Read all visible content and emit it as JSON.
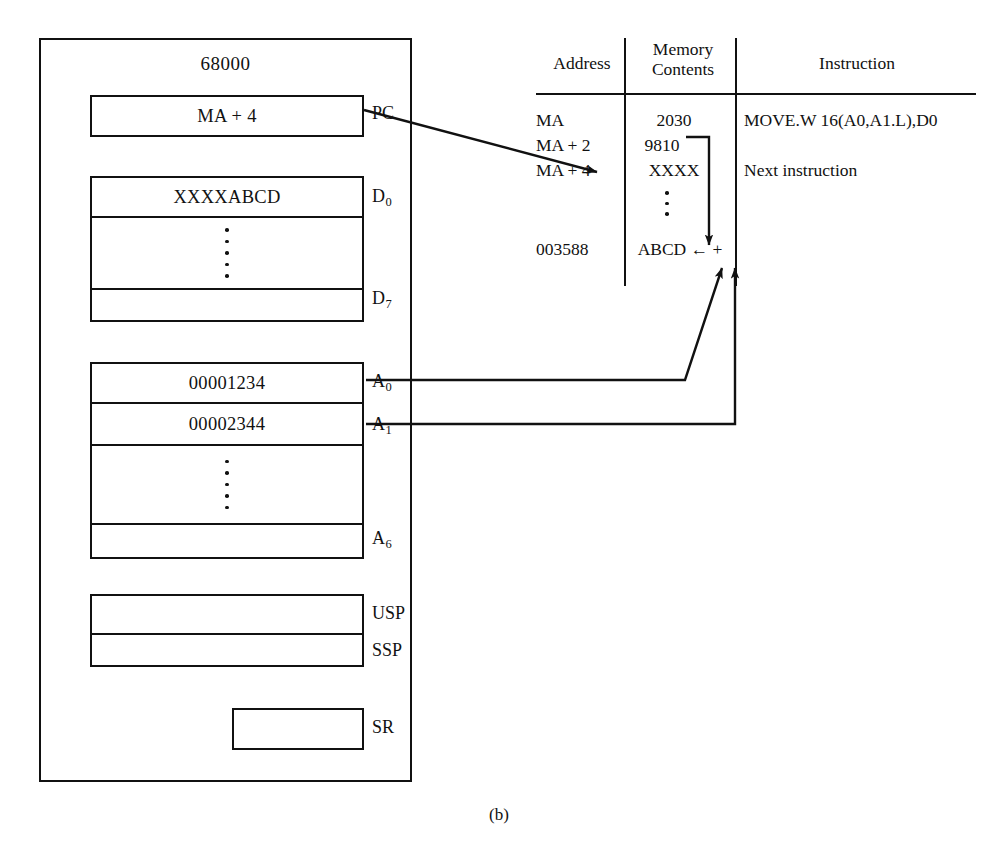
{
  "figure": {
    "caption": "(b)"
  },
  "cpu": {
    "title": "68000",
    "registers": [
      {
        "label": "PC",
        "sub": "",
        "value": "MA + 4"
      },
      {
        "label": "D",
        "sub": "0",
        "value": "XXXXABCD"
      },
      {
        "label": "D",
        "sub": "7",
        "value": ""
      },
      {
        "label": "A",
        "sub": "0",
        "value": "00001234"
      },
      {
        "label": "A",
        "sub": "1",
        "value": "00002344"
      },
      {
        "label": "A",
        "sub": "6",
        "value": ""
      },
      {
        "label": "USP",
        "sub": "",
        "value": ""
      },
      {
        "label": "SSP",
        "sub": "",
        "value": ""
      },
      {
        "label": "SR",
        "sub": "",
        "value": ""
      }
    ]
  },
  "memory_table": {
    "headers": {
      "address": "Address",
      "contents_line1": "Memory",
      "contents_line2": "Contents",
      "instruction": "Instruction"
    },
    "rows": [
      {
        "address": "MA",
        "contents": "2030",
        "instruction": "MOVE.W 16(A0,A1.L),D0"
      },
      {
        "address": "MA + 2",
        "contents": "9810",
        "instruction": ""
      },
      {
        "address": "MA + 4",
        "contents": "XXXX",
        "instruction": "Next instruction"
      },
      {
        "address": "",
        "contents": "",
        "instruction": ""
      },
      {
        "address": "003588",
        "contents": "ABCD ← +",
        "instruction": ""
      }
    ]
  },
  "colors": {
    "ink": "#111111",
    "paper": "#ffffff"
  }
}
